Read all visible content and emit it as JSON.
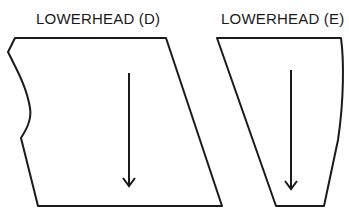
{
  "diagram": {
    "pieces": [
      {
        "id": "D",
        "label": "LOWERHEAD (D)",
        "outline_color": "#1a1a1a",
        "grain_arrow": "down"
      },
      {
        "id": "E",
        "label": "LOWERHEAD (E)",
        "outline_color": "#1a1a1a",
        "grain_arrow": "down"
      }
    ],
    "background": "#ffffff"
  }
}
